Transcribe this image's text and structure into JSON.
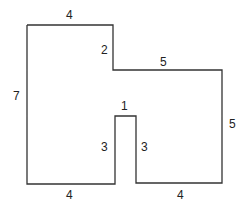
{
  "diagram": {
    "shape_color": "#333333",
    "labels": {
      "top": "4",
      "step_vertical": "2",
      "step_horizontal": "5",
      "left": "7",
      "right": "5",
      "notch_top": "1",
      "notch_left": "3",
      "notch_right": "3",
      "bottom_left": "4",
      "bottom_right": "4"
    }
  }
}
